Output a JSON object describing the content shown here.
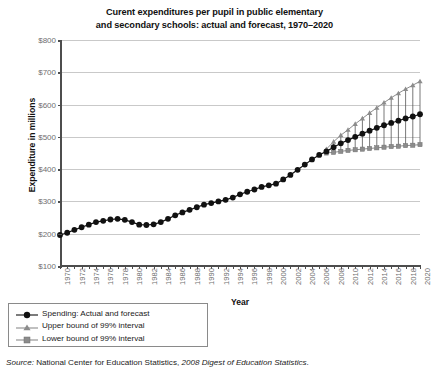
{
  "title": "Curent expenditures per pupil in public elementary\nand secondary schools: actual and forecast, 1970–2020",
  "title_line1": "Curent expenditures per pupil in public elementary",
  "title_line2": "and secondary schools: actual and forecast, 1970–2020",
  "source": {
    "prefix": "Source:",
    "plain": " National Center for Education Statistics, ",
    "italic": "2008 Digest of Education Statistics",
    "period": "."
  },
  "legend": {
    "items": [
      {
        "label": "Spending: Actual and forecast",
        "marker": "circle",
        "color": "#111111",
        "name": "legend-item-spending"
      },
      {
        "label": "Upper bound of 99% interval",
        "marker": "triangle",
        "color": "#8c8c8c",
        "name": "legend-item-upper"
      },
      {
        "label": "Lower bound of 99% interval",
        "marker": "square",
        "color": "#8c8c8c",
        "name": "legend-item-lower"
      }
    ]
  },
  "chart_data": {
    "type": "line",
    "title": "Curent expenditures per pupil in public elementary and secondary schools: actual and forecast, 1970–2020",
    "xlabel": "Year",
    "ylabel": "Expenditure in millions",
    "xlim": [
      1970,
      2020
    ],
    "ylim": [
      100,
      800
    ],
    "yticks": [
      100,
      200,
      300,
      400,
      500,
      600,
      700,
      800
    ],
    "ytick_labels": [
      "$100",
      "$200",
      "$300",
      "$400",
      "$500",
      "$600",
      "$700",
      "$800"
    ],
    "xticks": [
      1970,
      1972,
      1974,
      1976,
      1978,
      1980,
      1982,
      1984,
      1986,
      1988,
      1990,
      1992,
      1994,
      1996,
      1998,
      2000,
      2002,
      2004,
      2006,
      2008,
      2010,
      2012,
      2014,
      2016,
      2018,
      2020
    ],
    "xtick_labels": [
      "1970",
      "1972",
      "1974",
      "1976",
      "1978",
      "1980",
      "1982",
      "1984",
      "1986",
      "1988",
      "1990",
      "1992",
      "1994",
      "1996",
      "1998",
      "2000",
      "2002",
      "2004",
      "2006",
      "2008",
      "2010",
      "2012",
      "2014",
      "2016",
      "2018",
      "2020"
    ],
    "grid": true,
    "grid_axis": "y",
    "legend_position": "below-left",
    "forecast_start_year": 2007,
    "x": [
      1970,
      1971,
      1972,
      1973,
      1974,
      1975,
      1976,
      1977,
      1978,
      1979,
      1980,
      1981,
      1982,
      1983,
      1984,
      1985,
      1986,
      1987,
      1988,
      1989,
      1990,
      1991,
      1992,
      1993,
      1994,
      1995,
      1996,
      1997,
      1998,
      1999,
      2000,
      2001,
      2002,
      2003,
      2004,
      2005,
      2006,
      2007,
      2008,
      2009,
      2010,
      2011,
      2012,
      2013,
      2014,
      2015,
      2016,
      2017,
      2018,
      2019,
      2020
    ],
    "series": [
      {
        "name": "Spending: Actual and forecast",
        "marker": "circle",
        "color": "#111111",
        "values": [
          196,
          203,
          212,
          220,
          228,
          236,
          240,
          244,
          246,
          243,
          236,
          228,
          227,
          229,
          236,
          246,
          257,
          266,
          274,
          282,
          290,
          295,
          300,
          305,
          312,
          322,
          330,
          337,
          345,
          350,
          355,
          368,
          382,
          398,
          414,
          430,
          444,
          455,
          468,
          480,
          490,
          500,
          510,
          519,
          528,
          536,
          543,
          550,
          557,
          563,
          570
        ]
      },
      {
        "name": "Upper bound of 99% interval",
        "marker": "triangle",
        "color": "#8c8c8c",
        "values": [
          null,
          null,
          null,
          null,
          null,
          null,
          null,
          null,
          null,
          null,
          null,
          null,
          null,
          null,
          null,
          null,
          null,
          null,
          null,
          null,
          null,
          null,
          null,
          null,
          null,
          null,
          null,
          null,
          null,
          null,
          null,
          null,
          null,
          null,
          null,
          null,
          null,
          462,
          485,
          505,
          522,
          540,
          557,
          574,
          590,
          606,
          621,
          635,
          648,
          660,
          672
        ]
      },
      {
        "name": "Lower bound of 99% interval",
        "marker": "square",
        "color": "#8c8c8c",
        "values": [
          null,
          null,
          null,
          null,
          null,
          null,
          null,
          null,
          null,
          null,
          null,
          null,
          null,
          null,
          null,
          null,
          null,
          null,
          null,
          null,
          null,
          null,
          null,
          null,
          null,
          null,
          null,
          null,
          null,
          null,
          null,
          null,
          null,
          null,
          null,
          null,
          null,
          450,
          452,
          455,
          458,
          460,
          462,
          464,
          466,
          468,
          470,
          471,
          473,
          474,
          476
        ]
      }
    ]
  }
}
